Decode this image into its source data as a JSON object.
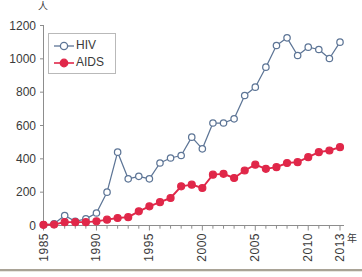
{
  "chart_data": {
    "type": "line",
    "title": "",
    "xlabel": "年",
    "ylabel": "人",
    "ylim": [
      0,
      1200
    ],
    "xlim": [
      1985,
      2013
    ],
    "ytick_labels": [
      "0",
      "200",
      "400",
      "600",
      "800",
      "1000",
      "1200"
    ],
    "yticks": [
      0,
      200,
      400,
      600,
      800,
      1000,
      1200
    ],
    "xtick_labels": [
      "1985",
      "1990",
      "1995",
      "2000",
      "2005",
      "2010",
      "2013"
    ],
    "xticks": [
      1985,
      1990,
      1995,
      2000,
      2005,
      2010,
      2013
    ],
    "grid": false,
    "legend_position": "upper-left-inside",
    "x": [
      1985,
      1986,
      1987,
      1988,
      1989,
      1990,
      1991,
      1992,
      1993,
      1994,
      1995,
      1996,
      1997,
      1998,
      1999,
      2000,
      2001,
      2002,
      2003,
      2004,
      2005,
      2006,
      2007,
      2008,
      2009,
      2010,
      2011,
      2012,
      2013
    ],
    "series": [
      {
        "name": "HIV",
        "color": "#5d7596",
        "marker": "open-circle",
        "values": [
          4,
          10,
          60,
          25,
          40,
          75,
          200,
          440,
          280,
          295,
          280,
          375,
          405,
          420,
          530,
          460,
          615,
          615,
          640,
          780,
          830,
          950,
          1080,
          1126,
          1020,
          1070,
          1056,
          1002,
          1100
        ]
      },
      {
        "name": "AIDS",
        "color": "#e02749",
        "marker": "filled-circle",
        "values": [
          4,
          6,
          20,
          20,
          20,
          25,
          35,
          45,
          50,
          85,
          115,
          140,
          165,
          235,
          245,
          225,
          305,
          310,
          285,
          330,
          365,
          340,
          350,
          375,
          380,
          410,
          440,
          450,
          470
        ]
      }
    ]
  },
  "axis": {
    "y_unit": "人",
    "x_unit": "年"
  },
  "legend": {
    "items": [
      {
        "label": "HIV",
        "color": "#5d7596",
        "marker": "open-circle"
      },
      {
        "label": "AIDS",
        "color": "#e02749",
        "marker": "filled-circle"
      }
    ]
  }
}
